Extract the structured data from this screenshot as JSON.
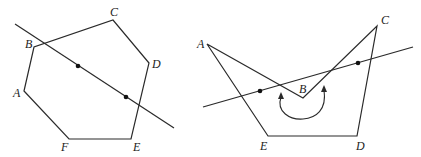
{
  "figures": [
    {
      "id": "convex-polygon",
      "description": "Convex hexagon ABCDEF cut by a line through two interior points",
      "vertices": [
        {
          "label": "A",
          "x": 24,
          "y": 91
        },
        {
          "label": "B",
          "x": 34,
          "y": 47
        },
        {
          "label": "C",
          "x": 113,
          "y": 20
        },
        {
          "label": "D",
          "x": 149,
          "y": 63
        },
        {
          "label": "E",
          "x": 131,
          "y": 139
        },
        {
          "label": "F",
          "x": 69,
          "y": 139
        }
      ],
      "vertex_labels": [
        {
          "text": "A",
          "x": 13,
          "y": 97
        },
        {
          "text": "B",
          "x": 25,
          "y": 48
        },
        {
          "text": "C",
          "x": 112,
          "y": 16
        },
        {
          "text": "D",
          "x": 152,
          "y": 68
        },
        {
          "text": "E",
          "x": 133,
          "y": 152
        },
        {
          "text": "F",
          "x": 62,
          "y": 152
        }
      ],
      "line": {
        "x1": 15,
        "y1": 24,
        "x2": 174,
        "y2": 128
      },
      "points": [
        {
          "x": 78,
          "y": 66
        },
        {
          "x": 126,
          "y": 97
        }
      ]
    },
    {
      "id": "concave-polygon",
      "description": "Concave pentagon ABCDE with reflex angle at B, cut by a line through two points",
      "vertices": [
        {
          "label": "A",
          "x": 207,
          "y": 44
        },
        {
          "label": "B",
          "x": 303,
          "y": 98
        },
        {
          "label": "C",
          "x": 377,
          "y": 26
        },
        {
          "label": "D",
          "x": 357,
          "y": 136
        },
        {
          "label": "E",
          "x": 268,
          "y": 136
        }
      ],
      "vertex_labels": [
        {
          "text": "A",
          "x": 198,
          "y": 47
        },
        {
          "text": "B",
          "x": 300,
          "y": 93
        },
        {
          "text": "C",
          "x": 381,
          "y": 24
        },
        {
          "text": "D",
          "x": 357,
          "y": 150
        },
        {
          "text": "E",
          "x": 260,
          "y": 150
        }
      ],
      "line": {
        "x1": 203,
        "y1": 107,
        "x2": 413,
        "y2": 47
      },
      "points": [
        {
          "x": 260,
          "y": 91
        },
        {
          "x": 358,
          "y": 63
        }
      ],
      "angle_arc": {
        "label": "reflex angle at B"
      }
    }
  ]
}
